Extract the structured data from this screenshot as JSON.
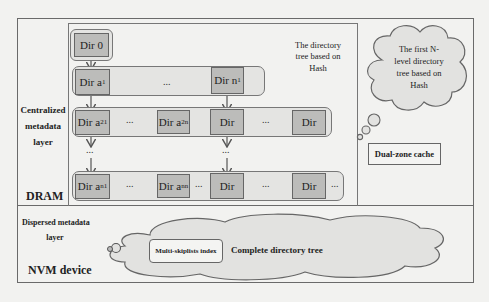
{
  "diagram": {
    "dram_section": {
      "label": "DRAM",
      "layer_label": "Centralized metadata layer",
      "layer_label_lines": [
        "Centralized",
        "metadata",
        "layer"
      ],
      "tree_caption_lines": [
        "The directory",
        "tree based on",
        "Hash"
      ],
      "root": {
        "name": "Dir",
        "sub": "0"
      },
      "rows": [
        {
          "nodes": [
            {
              "name": "Dir a",
              "sub": "1"
            },
            {
              "name": "Dir n",
              "sub": "1"
            }
          ],
          "ellipsis": "..."
        },
        {
          "nodes": [
            {
              "name": "Dir a",
              "sub": "21"
            },
            {
              "name": "Dir a",
              "sub": "2n"
            },
            {
              "name": "Dir",
              "sub": ""
            },
            {
              "name": "Dir",
              "sub": ""
            }
          ],
          "ellipsis": "..."
        },
        {
          "nodes": [
            {
              "name": "Dir a",
              "sub": "n1"
            },
            {
              "name": "Dir a",
              "sub": "nn"
            },
            {
              "name": "Dir",
              "sub": ""
            },
            {
              "name": "Dir",
              "sub": ""
            }
          ],
          "ellipsis": "..."
        }
      ],
      "vertical_ellipsis": "...",
      "cache_cloud_lines": [
        "The first N-",
        "level directory",
        "tree based on",
        "Hash"
      ],
      "cache_box_label": "Dual-zone cache"
    },
    "nvm_section": {
      "label": "NVM device",
      "layer_label_lines": [
        "Dispersed metadata",
        "layer"
      ],
      "index_box_label": "Multi-skiplists index",
      "cloud_label": "Complete directory tree"
    },
    "colors": {
      "background": "#f2f2f0",
      "node_fill": "#bcbcba",
      "row_fill": "#e4e4e2",
      "cloud_fill": "#e2e2e0",
      "stroke": "#666666"
    }
  }
}
